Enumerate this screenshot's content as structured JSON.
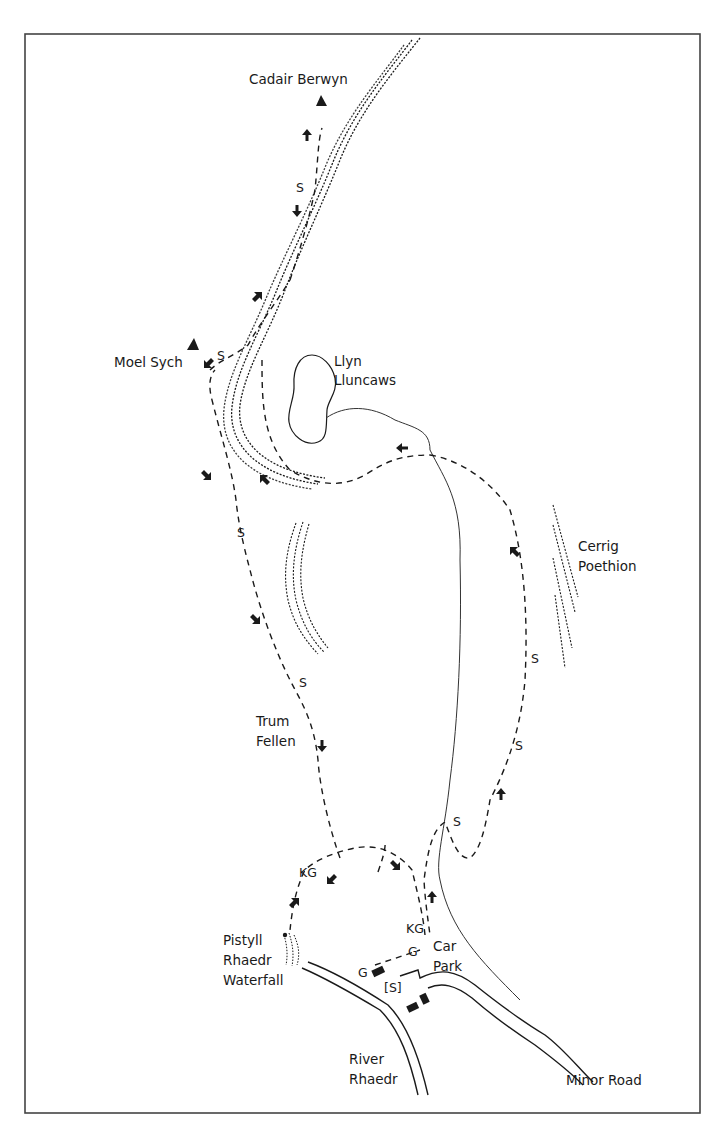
{
  "map": {
    "type": "walking route sketch map",
    "colors": {
      "ink": "#1a1a1a",
      "border": "#444444",
      "background": "#ffffff"
    },
    "summits": [
      {
        "name": "Cadair Berwyn",
        "icon": "summit-triangle-icon"
      },
      {
        "name": "Moel Sych",
        "icon": "summit-triangle-icon"
      }
    ],
    "labels": {
      "cadair_berwyn": "Cadair Berwyn",
      "moel_sych": "Moel Sych",
      "llyn_line1": "Llyn",
      "llyn_line2": "Lluncaws",
      "cerrig_line1": "Cerrig",
      "cerrig_line2": "Poethion",
      "trum_line1": "Trum",
      "trum_line2": "Fellen",
      "pistyll_line1": "Pistyll",
      "pistyll_line2": "Rhaedr",
      "pistyll_line3": "Waterfall",
      "car_line1": "Car",
      "car_line2": "Park",
      "river_line1": "River",
      "river_line2": "Rhaedr",
      "minor_road": "Minor Road"
    },
    "markers": {
      "stile": "S",
      "stile_optional": "[S]",
      "kissing_gate": "KG",
      "gate": "G"
    },
    "legend_codes": {
      "S": "stile",
      "KG": "kissing gate",
      "G": "gate",
      "[S]": "stile"
    }
  }
}
